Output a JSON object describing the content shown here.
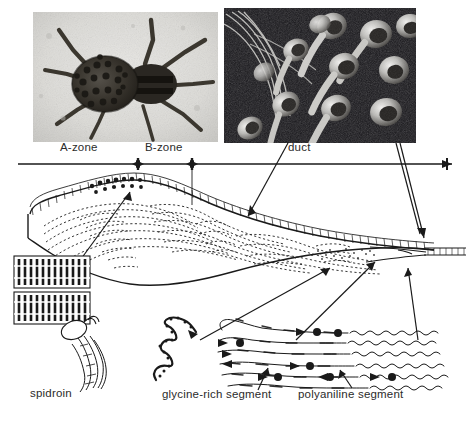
{
  "figure": {
    "background_color": "#ffffff",
    "ink_color": "#1a1a1a"
  },
  "photographs": [
    {
      "name": "spider-photo",
      "subject": "spider with spiderlings on abdomen",
      "style": "grayscale photograph",
      "x": 33,
      "y": 12,
      "width": 185,
      "height": 130
    },
    {
      "name": "spinneret-sem-photo",
      "subject": "scanning electron micrograph of spinneret spigots with silk fibres",
      "style": "grayscale SEM micrograph",
      "x": 224,
      "y": 8,
      "width": 192,
      "height": 135
    }
  ],
  "zone_bar": {
    "name": "zone-measurement-bar",
    "y": 164,
    "x_start": 18,
    "x_end": 452,
    "ticks": [
      138,
      192,
      447
    ],
    "labels": [
      {
        "text": "A-zone",
        "x": 60,
        "y": 146
      },
      {
        "text": "B-zone",
        "x": 145,
        "y": 146
      },
      {
        "text": "duct",
        "x": 288,
        "y": 146
      }
    ]
  },
  "callout_labels": [
    {
      "text": "spidroin",
      "x": 30,
      "y": 392
    },
    {
      "text": "glycine-rich segment",
      "x": 162,
      "y": 393
    },
    {
      "text": "polyaniline segment",
      "x": 298,
      "y": 393
    }
  ],
  "diagram": {
    "gland_name": "silk-gland-cross-section",
    "features": [
      "epithelial cell layer along upper wall",
      "concentric dotted flow lines in lumen",
      "narrowing duct toward right",
      "secretory granules in A-zone roof"
    ]
  },
  "molecular_insets": [
    {
      "name": "beta-sheet-crystal-upper",
      "x": 14,
      "y": 256,
      "width": 76,
      "height": 32
    },
    {
      "name": "beta-sheet-crystal-lower",
      "x": 14,
      "y": 292,
      "width": 76,
      "height": 32
    },
    {
      "name": "spidroin-molecule",
      "x": 60,
      "y": 315,
      "width": 52,
      "height": 70
    },
    {
      "name": "random-coil-spidroin",
      "x": 150,
      "y": 316,
      "width": 60,
      "height": 70
    },
    {
      "name": "aligned-polymer-chains",
      "x": 215,
      "y": 312,
      "width": 245,
      "height": 78
    }
  ]
}
